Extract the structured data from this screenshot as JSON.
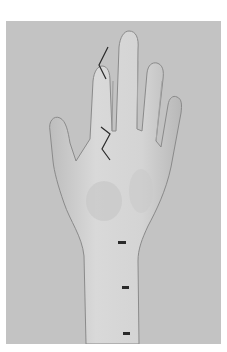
{
  "image": {
    "subject": "palmar view of left hand and forearm with surgical incision markings",
    "colors": {
      "background": "#c3c3c3",
      "skin": "#d6d6d6",
      "skin_shadow": "#9a9a9a",
      "marking": "#2a2a2a"
    },
    "markings": [
      {
        "name": "zigzag-incision-index-finger",
        "shape": "V"
      },
      {
        "name": "zigzag-incision-palm",
        "shape": "Z"
      },
      {
        "name": "forearm-mark-1"
      },
      {
        "name": "forearm-mark-2"
      },
      {
        "name": "forearm-mark-3"
      }
    ]
  }
}
